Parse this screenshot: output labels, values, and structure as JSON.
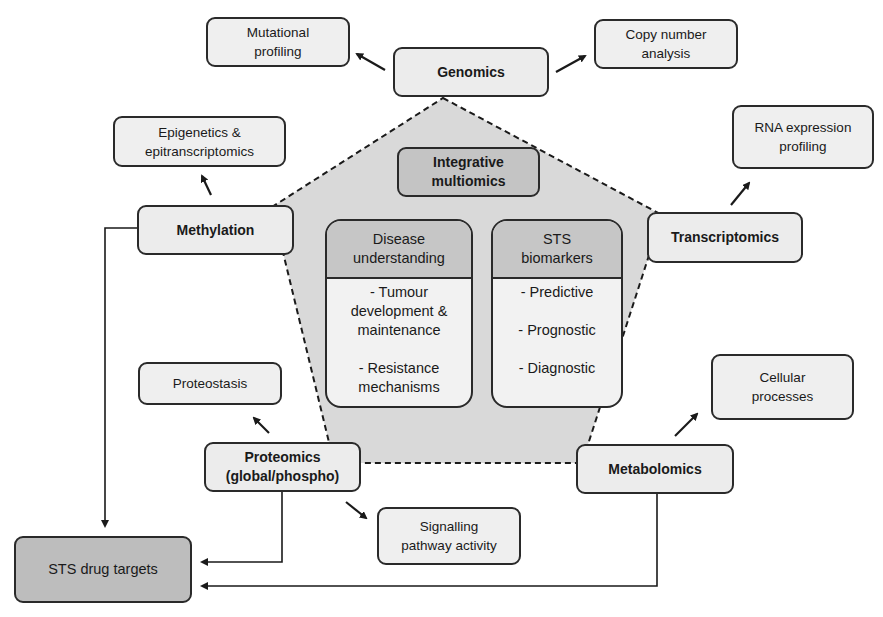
{
  "diagram": {
    "center": {
      "title": "Integrative\nmultiomics",
      "cards": [
        {
          "heading": "Disease\nunderstanding",
          "items": [
            "- Tumour\ndevelopment &\nmaintenance",
            "- Resistance\nmechanisms"
          ]
        },
        {
          "heading": "STS\nbiomarkers",
          "items": [
            "- Predictive",
            "- Prognostic",
            "- Diagnostic"
          ]
        }
      ]
    },
    "omics_nodes": {
      "genomics": "Genomics",
      "transcriptomics": "Transcriptomics",
      "metabolomics": "Metabolomics",
      "proteomics": "Proteomics\n(global/phospho)",
      "methylation": "Methylation"
    },
    "outputs": {
      "mutational_profiling": "Mutational\nprofiling",
      "copy_number_analysis": "Copy number\nanalysis",
      "rna_expression_profiling": "RNA expression\nprofiling",
      "cellular_processes": "Cellular\nprocesses",
      "signalling_pathway_activity": "Signalling\npathway activity",
      "proteostasis": "Proteostasis",
      "epigenetics": "Epigenetics &\nepitranscriptomics",
      "sts_drug_targets": "STS drug targets"
    },
    "edges": [
      {
        "from": "Genomics",
        "to": "Mutational profiling"
      },
      {
        "from": "Genomics",
        "to": "Copy number analysis"
      },
      {
        "from": "Transcriptomics",
        "to": "RNA expression profiling"
      },
      {
        "from": "Metabolomics",
        "to": "Cellular processes"
      },
      {
        "from": "Proteomics (global/phospho)",
        "to": "Proteostasis"
      },
      {
        "from": "Proteomics (global/phospho)",
        "to": "Signalling pathway activity"
      },
      {
        "from": "Methylation",
        "to": "Epigenetics & epitranscriptomics"
      },
      {
        "from": "Methylation",
        "to": "STS drug targets"
      },
      {
        "from": "Proteomics (global/phospho)",
        "to": "STS drug targets"
      },
      {
        "from": "Metabolomics",
        "to": "STS drug targets"
      }
    ],
    "colors": {
      "pentagon_fill": "#d9d9d9",
      "box_fill": "#ececec",
      "dark_box_fill": "#bdbdbd",
      "stroke": "#2a2a2a"
    }
  }
}
